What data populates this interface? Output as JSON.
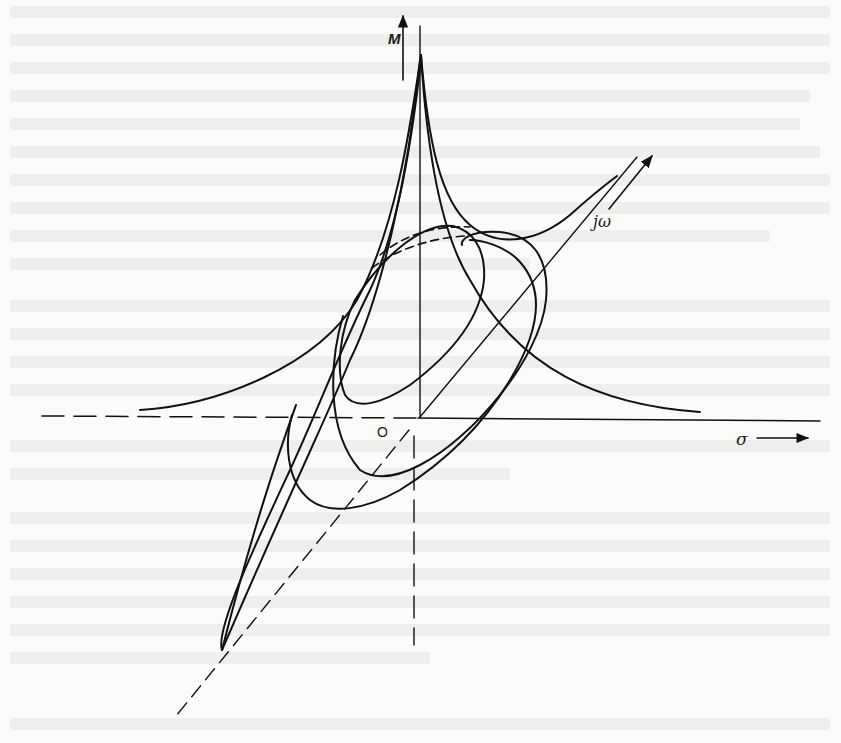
{
  "figure": {
    "axes": {
      "vertical_label": "M",
      "imaginary_label": "jω",
      "real_label": "σ",
      "origin_label": "O"
    },
    "colors": {
      "ink": "#111111",
      "paper": "#fbfbfa",
      "bleed_text": "#eeeeec"
    }
  }
}
